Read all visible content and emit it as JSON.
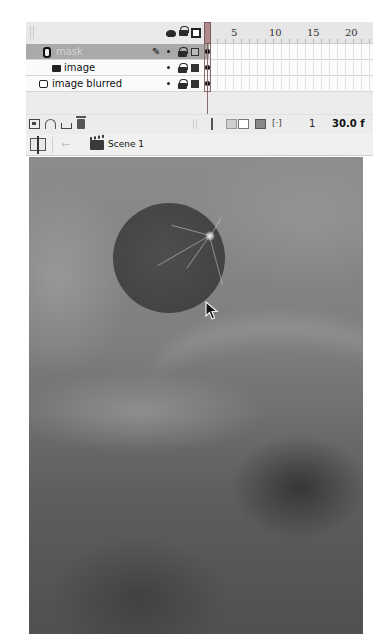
{
  "timeline": {
    "header_icons": {
      "eye": "eye-icon",
      "lock": "lock-icon",
      "outline": "outline-square-icon"
    },
    "ruler": {
      "labels": [
        "1",
        "5",
        "10",
        "15",
        "20"
      ],
      "current_frame_marker": "1"
    },
    "layers": [
      {
        "name": "mask",
        "type": "mask",
        "selected": true,
        "visible_dot": true,
        "locked": true,
        "outline": "outline-only",
        "extra_icon": "pen-icon"
      },
      {
        "name": "image",
        "type": "masked",
        "selected": false,
        "visible_dot": true,
        "locked": true,
        "outline": "filled"
      },
      {
        "name": "image blurred",
        "type": "normal",
        "selected": false,
        "visible_dot": true,
        "locked": true,
        "outline": "filled"
      }
    ],
    "footer": {
      "current_frame": "1",
      "frame_rate": "30.0 f"
    }
  },
  "edit_bar": {
    "scene_label": "Scene 1"
  },
  "colors": {
    "panel_bg": "#ececec",
    "selected_layer_bg": "#a9a9a9",
    "playhead": "#b08b8b",
    "stage_base": "#7e7e7e"
  }
}
